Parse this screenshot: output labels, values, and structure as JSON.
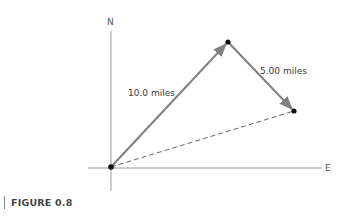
{
  "diagram": {
    "axes": {
      "north_label": "N",
      "east_label": "E"
    },
    "vectors": [
      {
        "label": "10.0 miles",
        "from": "origin",
        "to": "point-1",
        "style": "solid",
        "color": "#808080"
      },
      {
        "label": "5.00 miles",
        "from": "point-1",
        "to": "point-2",
        "style": "solid",
        "color": "#808080"
      },
      {
        "label": "",
        "from": "origin",
        "to": "point-2",
        "style": "dashed",
        "color": "#666666"
      }
    ],
    "points": [
      "origin",
      "point-1",
      "point-2"
    ]
  },
  "caption": {
    "text": "FIGURE 0.8"
  }
}
